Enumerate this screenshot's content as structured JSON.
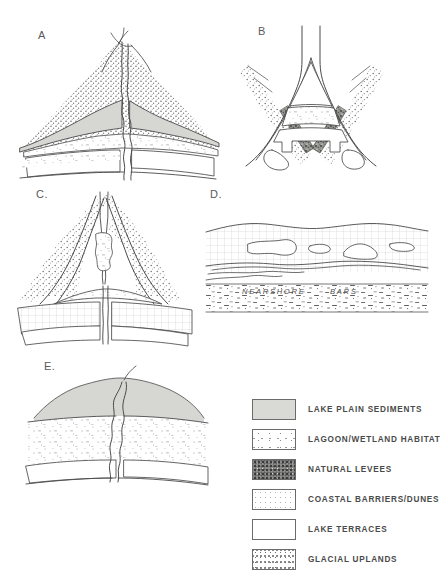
{
  "figure": {
    "background": "#ffffff",
    "ink_color": "#4a4a4a"
  },
  "panels": [
    {
      "id": "A",
      "label": "A",
      "caption": ""
    },
    {
      "id": "B",
      "label": "B",
      "caption": ""
    },
    {
      "id": "C",
      "label": "C.",
      "caption": ""
    },
    {
      "id": "D",
      "label": "D.",
      "caption": ""
    },
    {
      "id": "E",
      "label": "E.",
      "caption": ""
    }
  ],
  "panel_d_annotations": [
    {
      "text": "NEARSHORE"
    },
    {
      "text": "BARS"
    }
  ],
  "legend": {
    "items": [
      {
        "label": "LAKE PLAIN SEDIMENTS",
        "pattern": "solid-gray",
        "color": "#d9d9d6"
      },
      {
        "label": "LAGOON/WETLAND HABITAT",
        "pattern": "sparse-stipple",
        "color": "#ffffff"
      },
      {
        "label": "NATURAL LEVEES",
        "pattern": "dense-speckle",
        "color": "#8e8e8c"
      },
      {
        "label": "COASTAL BARRIERS/DUNES",
        "pattern": "fine-stipple",
        "color": "#ffffff"
      },
      {
        "label": "LAKE TERRACES",
        "pattern": "blank",
        "color": "#ffffff"
      },
      {
        "label": "GLACIAL UPLANDS",
        "pattern": "medium-stipple",
        "color": "#ffffff"
      }
    ]
  }
}
